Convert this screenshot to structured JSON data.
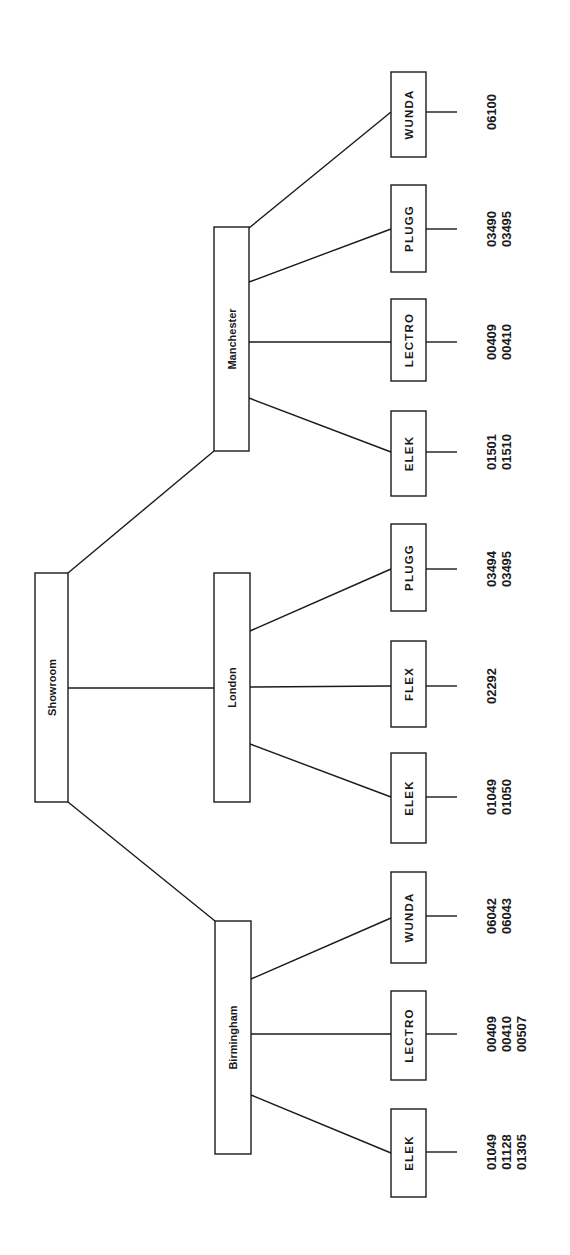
{
  "diagram": {
    "colors": {
      "stroke": "#1a1a1a",
      "background": "#ffffff"
    },
    "root": {
      "label": "Showroom",
      "box": {
        "x": 35,
        "y": 573,
        "w": 33,
        "h": 229
      }
    },
    "cities": [
      {
        "label": "Manchester",
        "box": {
          "x": 214,
          "y": 227,
          "w": 35,
          "h": 224
        },
        "root_edge": {
          "x1": 68,
          "y1": 573,
          "x2": 214,
          "y2": 451
        },
        "brands": [
          {
            "label": "WUNDA",
            "box": {
              "x": 391,
              "y": 72,
              "w": 35,
              "h": 85
            },
            "edge_from_y": 228,
            "edge_to_y": 112,
            "stub_y": 112,
            "codes": [
              "06100"
            ]
          },
          {
            "label": "PLUGG",
            "box": {
              "x": 391,
              "y": 185,
              "w": 35,
              "h": 87
            },
            "edge_from_y": 282,
            "edge_to_y": 229,
            "stub_y": 229,
            "codes": [
              "03490",
              "03495"
            ]
          },
          {
            "label": "LECTRO",
            "box": {
              "x": 391,
              "y": 299,
              "w": 35,
              "h": 82
            },
            "edge_from_y": 342,
            "edge_to_y": 342,
            "stub_y": 342,
            "codes": [
              "00409",
              "00410"
            ]
          },
          {
            "label": "ELEK",
            "box": {
              "x": 391,
              "y": 411,
              "w": 35,
              "h": 85
            },
            "edge_from_y": 398,
            "edge_to_y": 452,
            "stub_y": 452,
            "codes": [
              "01501",
              "01510"
            ]
          }
        ]
      },
      {
        "label": "London",
        "box": {
          "x": 214,
          "y": 573,
          "w": 36,
          "h": 229
        },
        "root_edge": {
          "x1": 68,
          "y1": 688,
          "x2": 214,
          "y2": 688
        },
        "brands": [
          {
            "label": "PLUGG",
            "box": {
              "x": 391,
              "y": 524,
              "w": 35,
              "h": 87
            },
            "edge_from_y": 631,
            "edge_to_y": 569,
            "stub_y": 569,
            "codes": [
              "03494",
              "03495"
            ]
          },
          {
            "label": "FLEX",
            "box": {
              "x": 391,
              "y": 641,
              "w": 35,
              "h": 86
            },
            "edge_from_y": 687,
            "edge_to_y": 686,
            "stub_y": 686,
            "codes": [
              "02292"
            ]
          },
          {
            "label": "ELEK",
            "box": {
              "x": 391,
              "y": 753,
              "w": 35,
              "h": 90
            },
            "edge_from_y": 744,
            "edge_to_y": 797,
            "stub_y": 797,
            "codes": [
              "01049",
              "01050"
            ]
          }
        ]
      },
      {
        "label": "Birmingham",
        "box": {
          "x": 215,
          "y": 921,
          "w": 36,
          "h": 233
        },
        "root_edge": {
          "x1": 68,
          "y1": 802,
          "x2": 215,
          "y2": 921
        },
        "brands": [
          {
            "label": "WUNDA",
            "box": {
              "x": 391,
              "y": 872,
              "w": 35,
              "h": 91
            },
            "edge_from_y": 979,
            "edge_to_y": 918,
            "stub_y": 916,
            "codes": [
              "06042",
              "06043"
            ]
          },
          {
            "label": "LECTRO",
            "box": {
              "x": 391,
              "y": 991,
              "w": 35,
              "h": 89
            },
            "edge_from_y": 1034,
            "edge_to_y": 1034,
            "stub_y": 1034,
            "codes": [
              "00409",
              "00410",
              "00507"
            ]
          },
          {
            "label": "ELEK",
            "box": {
              "x": 391,
              "y": 1109,
              "w": 35,
              "h": 88
            },
            "edge_from_y": 1095,
            "edge_to_y": 1153,
            "stub_y": 1152,
            "codes": [
              "01049",
              "01128",
              "01305"
            ]
          }
        ]
      }
    ],
    "layout": {
      "stub_length": 31,
      "code_first_x": 491,
      "code_line_spacing": 15
    }
  }
}
